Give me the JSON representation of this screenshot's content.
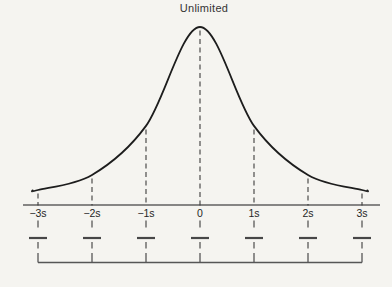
{
  "figure": {
    "title": "Unlimited"
  },
  "chart_data": {
    "type": "line",
    "title": "Unlimited",
    "xlabel": "",
    "ylabel": "",
    "x_tick_labels": [
      "−3s",
      "−2s",
      "−1s",
      "0",
      "1s",
      "2s",
      "3s"
    ],
    "x_tick_sigmas": [
      -3,
      -2,
      -1,
      0,
      1,
      2,
      3
    ],
    "ticks": [
      {
        "label": "−3s",
        "sigma": -3,
        "h": 0.003
      },
      {
        "label": "−2s",
        "sigma": -2,
        "h": 0.095
      },
      {
        "label": "−1s",
        "sigma": -1,
        "h": 0.395
      },
      {
        "label": "0",
        "sigma": 0,
        "h": 1.0
      },
      {
        "label": "1s",
        "sigma": 1,
        "h": 0.395
      },
      {
        "label": "2s",
        "sigma": 2,
        "h": 0.095
      },
      {
        "label": "3s",
        "sigma": 3,
        "h": 0.003
      }
    ],
    "curve_points": [
      {
        "sigma": -3.1,
        "h": 0.0
      },
      {
        "sigma": -3.0,
        "h": 0.003
      },
      {
        "sigma": -2.0,
        "h": 0.095
      },
      {
        "sigma": -1.0,
        "h": 0.395
      },
      {
        "sigma": 0.0,
        "h": 1.0
      },
      {
        "sigma": 1.0,
        "h": 0.395
      },
      {
        "sigma": 2.0,
        "h": 0.095
      },
      {
        "sigma": 3.0,
        "h": 0.003
      },
      {
        "sigma": 3.1,
        "h": 0.0
      }
    ],
    "grid": "dashed vertical guide at every sigma tick, from curve down through axis to bracket",
    "legend": "none",
    "annotations": "short horizontal interval bars below each tick; bottom bracket line connecting risers at all seven sigma positions"
  },
  "colors": {
    "background": "#f5f4f0",
    "curve": "#1d1d1d",
    "axis": "#606060",
    "dashed_guides": "#3c3c3c",
    "interval_bars": "#474747",
    "bracket": "#565656",
    "labels": "#262626",
    "title": "#333333"
  }
}
